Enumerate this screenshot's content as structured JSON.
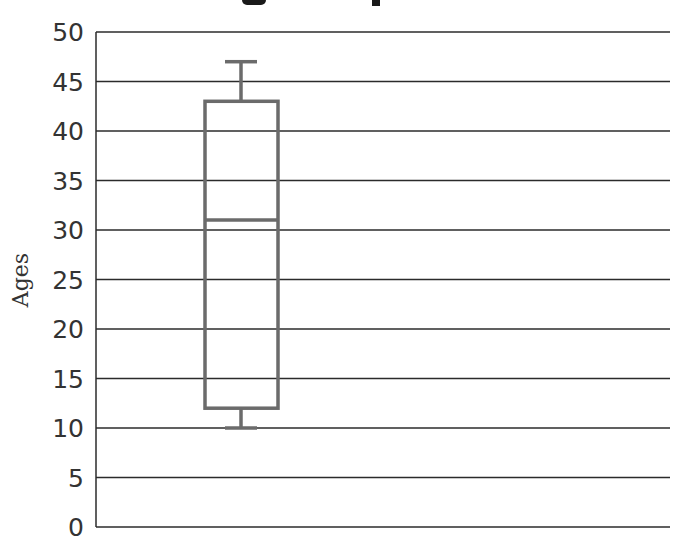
{
  "chart_data": {
    "type": "box",
    "title": "",
    "xlabel": "",
    "ylabel": "Ages",
    "ylim": [
      0,
      50
    ],
    "yticks": [
      0,
      5,
      10,
      15,
      20,
      25,
      30,
      35,
      40,
      45,
      50
    ],
    "grid": true,
    "series": [
      {
        "name": "Ages",
        "min": 10,
        "q1": 12,
        "median": 31,
        "q3": 43,
        "max": 47
      }
    ]
  },
  "colors": {
    "box": "#6b6b6b",
    "grid": "#2b2b2b",
    "text": "#333333"
  }
}
